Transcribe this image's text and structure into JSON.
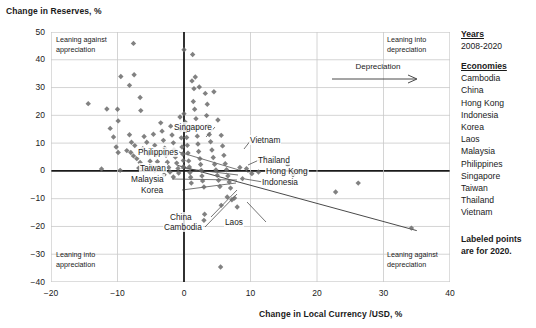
{
  "chart_data": {
    "type": "scatter",
    "title": "",
    "xlabel": "Change in Local Currency /USD, %",
    "ylabel": "Change in Reserves, %",
    "xlim": [
      -20,
      40
    ],
    "ylim": [
      -40,
      50
    ],
    "xticks": [
      -20,
      -10,
      0,
      10,
      20,
      30,
      40
    ],
    "yticks": [
      50,
      40,
      30,
      20,
      10,
      0,
      -10,
      -20,
      -30,
      -40
    ],
    "grid": true,
    "legend_position": "right",
    "points": [
      [
        -14.4,
        24.2
      ],
      [
        -11.6,
        22.3
      ],
      [
        -10.0,
        22.2
      ],
      [
        -9.9,
        18.0
      ],
      [
        -7.6,
        45.9
      ],
      [
        -9.5,
        34.0
      ],
      [
        -7.5,
        34.6
      ],
      [
        -8.2,
        30.8
      ],
      [
        -6.6,
        26.4
      ],
      [
        -6.5,
        21.7
      ],
      [
        -11.1,
        15.3
      ],
      [
        -10.6,
        12.2
      ],
      [
        -10.2,
        8.6
      ],
      [
        -9.9,
        6.6
      ],
      [
        -12.4,
        0.7
      ],
      [
        -9.6,
        0.2
      ],
      [
        -8.2,
        13.0
      ],
      [
        -7.9,
        10.3
      ],
      [
        -7.4,
        9.1
      ],
      [
        -8.6,
        7.3
      ],
      [
        -8.0,
        6.6
      ],
      [
        -7.6,
        5.4
      ],
      [
        -7.1,
        4.4
      ],
      [
        -6.6,
        3.0
      ],
      [
        -6.2,
        8.0
      ],
      [
        -6.0,
        12.4
      ],
      [
        -5.6,
        10.3
      ],
      [
        -5.3,
        6.1
      ],
      [
        -5.1,
        3.5
      ],
      [
        -4.9,
        1.5
      ],
      [
        -6.8,
        1.0
      ],
      [
        -5.9,
        0.3
      ],
      [
        -4.6,
        13.2
      ],
      [
        -4.4,
        9.2
      ],
      [
        -4.2,
        5.9
      ],
      [
        -4.0,
        3.3
      ],
      [
        -3.8,
        1.2
      ],
      [
        -4.4,
        0.1
      ],
      [
        -3.5,
        17.3
      ],
      [
        -3.3,
        14.3
      ],
      [
        -3.1,
        11.0
      ],
      [
        -2.9,
        8.2
      ],
      [
        -2.7,
        5.6
      ],
      [
        -2.5,
        3.1
      ],
      [
        -2.3,
        1.2
      ],
      [
        -2.1,
        -0.4
      ],
      [
        -3.0,
        -1.4
      ],
      [
        -2.0,
        16.1
      ],
      [
        -1.8,
        12.9
      ],
      [
        -1.6,
        10.1
      ],
      [
        -1.5,
        7.6
      ],
      [
        -1.3,
        5.0
      ],
      [
        -1.1,
        2.8
      ],
      [
        -0.9,
        0.9
      ],
      [
        -0.8,
        -0.8
      ],
      [
        -1.6,
        -2.2
      ],
      [
        -0.6,
        19.4
      ],
      [
        -0.5,
        14.9
      ],
      [
        -0.4,
        11.9
      ],
      [
        -0.3,
        8.6
      ],
      [
        -0.2,
        6.1
      ],
      [
        -0.1,
        3.7
      ],
      [
        -0.1,
        1.5
      ],
      [
        0.0,
        43.6
      ],
      [
        0.0,
        20.6
      ],
      [
        0.2,
        17.5
      ],
      [
        0.3,
        14.6
      ],
      [
        0.4,
        12.0
      ],
      [
        0.5,
        9.2
      ],
      [
        0.6,
        6.4
      ],
      [
        0.7,
        3.6
      ],
      [
        0.8,
        1.4
      ],
      [
        0.9,
        -0.6
      ],
      [
        1.0,
        -2.3
      ],
      [
        1.1,
        -4.4
      ],
      [
        1.3,
        41.9
      ],
      [
        1.2,
        32.4
      ],
      [
        1.5,
        29.6
      ],
      [
        1.4,
        25.0
      ],
      [
        1.6,
        22.2
      ],
      [
        1.8,
        18.8
      ],
      [
        1.9,
        15.5
      ],
      [
        2.0,
        12.5
      ],
      [
        2.1,
        9.7
      ],
      [
        2.2,
        7.0
      ],
      [
        2.4,
        4.4
      ],
      [
        2.5,
        2.3
      ],
      [
        2.6,
        0.2
      ],
      [
        2.7,
        -1.8
      ],
      [
        2.8,
        -3.6
      ],
      [
        3.0,
        -5.8
      ],
      [
        1.7,
        33.8
      ],
      [
        2.3,
        30.2
      ],
      [
        3.2,
        27.9
      ],
      [
        3.5,
        24.0
      ],
      [
        3.4,
        19.9
      ],
      [
        3.6,
        16.2
      ],
      [
        3.8,
        13.1
      ],
      [
        4.0,
        10.5
      ],
      [
        4.2,
        7.5
      ],
      [
        4.4,
        4.8
      ],
      [
        4.6,
        2.4
      ],
      [
        4.8,
        0.3
      ],
      [
        5.0,
        -1.6
      ],
      [
        5.2,
        -3.4
      ],
      [
        5.4,
        -5.6
      ],
      [
        4.5,
        28.5
      ],
      [
        5.1,
        18.3
      ],
      [
        5.6,
        12.8
      ],
      [
        5.8,
        9.0
      ],
      [
        6.0,
        5.6
      ],
      [
        6.2,
        2.6
      ],
      [
        6.4,
        0.4
      ],
      [
        6.6,
        -1.8
      ],
      [
        6.8,
        -4.0
      ],
      [
        7.0,
        -6.2
      ],
      [
        6.5,
        -9.4
      ],
      [
        7.2,
        -10.4
      ],
      [
        7.6,
        -9.8
      ],
      [
        8.0,
        -13.0
      ],
      [
        5.6,
        -12.4
      ],
      [
        3.1,
        -15.6
      ],
      [
        3.0,
        -17.8
      ],
      [
        5.5,
        -34.6
      ],
      [
        8.4,
        1.2
      ],
      [
        8.8,
        -2.8
      ],
      [
        9.4,
        0.8
      ],
      [
        10.2,
        -1.0
      ],
      [
        11.2,
        -0.4
      ],
      [
        12.2,
        4.6
      ],
      [
        15.6,
        2.2
      ],
      [
        16.4,
        -1.4
      ],
      [
        22.8,
        -7.6
      ],
      [
        26.2,
        -4.4
      ],
      [
        34.2,
        -20.6
      ]
    ],
    "trend_line": {
      "x0": -1.0,
      "y0": 2.0,
      "x1": 35.0,
      "y1": -21.5
    },
    "labeled_points": [
      {
        "name": "Singapore",
        "label_x": 122,
        "label_y": 90,
        "anchor_x": 155,
        "anchor_y": 105
      },
      {
        "name": "Vietnam",
        "label_x": 198,
        "label_y": 103,
        "anchor_x": 193,
        "anchor_y": 117
      },
      {
        "name": "Philippines",
        "label_x": 86,
        "label_y": 115,
        "anchor_x": 188,
        "anchor_y": 138
      },
      {
        "name": "Thailand",
        "label_x": 206,
        "label_y": 123,
        "anchor_x": 197,
        "anchor_y": 133
      },
      {
        "name": "Hong Kong",
        "label_x": 214,
        "label_y": 134,
        "anchor_x": 196,
        "anchor_y": 140
      },
      {
        "name": "Indonesia",
        "label_x": 210,
        "label_y": 145,
        "anchor_x": 194,
        "anchor_y": 147
      },
      {
        "name": "Taiwan",
        "label_x": 88,
        "label_y": 131,
        "anchor_x": 187,
        "anchor_y": 143
      },
      {
        "name": "Malaysia",
        "label_x": 79,
        "label_y": 142,
        "anchor_x": 186,
        "anchor_y": 148
      },
      {
        "name": "Korea",
        "label_x": 89,
        "label_y": 153,
        "anchor_x": 185,
        "anchor_y": 151
      },
      {
        "name": "China",
        "label_x": 118,
        "label_y": 180,
        "anchor_x": 186,
        "anchor_y": 158
      },
      {
        "name": "Cambodia",
        "label_x": 112,
        "label_y": 190,
        "anchor_x": 186,
        "anchor_y": 162
      },
      {
        "name": "Laos",
        "label_x": 173,
        "label_y": 185,
        "anchor_x": 196,
        "anchor_y": 170
      }
    ],
    "quadrant_notes": [
      {
        "id": "top-left",
        "line1": "Leaning against",
        "line2": "appreciation"
      },
      {
        "id": "top-right",
        "line1": "Leaning into",
        "line2": "depreciation"
      },
      {
        "id": "bottom-left",
        "line1": "Leaning into",
        "line2": "appreciation"
      },
      {
        "id": "bottom-right",
        "line1": "Leaning against",
        "line2": "depreciation"
      }
    ],
    "direction_annotation": "Depreciation",
    "series_color": "#6b6b6b",
    "trend_color": "#4a4a4a",
    "grid_color": "#c9c9c9",
    "axis_color": "#1a1a1a"
  },
  "legend": {
    "years_heading": "Years",
    "years_value": "2008-2020",
    "economies_heading": "Economies",
    "economies": [
      "Cambodia",
      "China",
      "Hong Kong",
      "Indonesia",
      "Korea",
      "Laos",
      "Malaysia",
      "Philippines",
      "Singapore",
      "Taiwan",
      "Thailand",
      "Vietnam"
    ],
    "footnote_line1": "Labeled points",
    "footnote_line2": "are for 2020."
  }
}
